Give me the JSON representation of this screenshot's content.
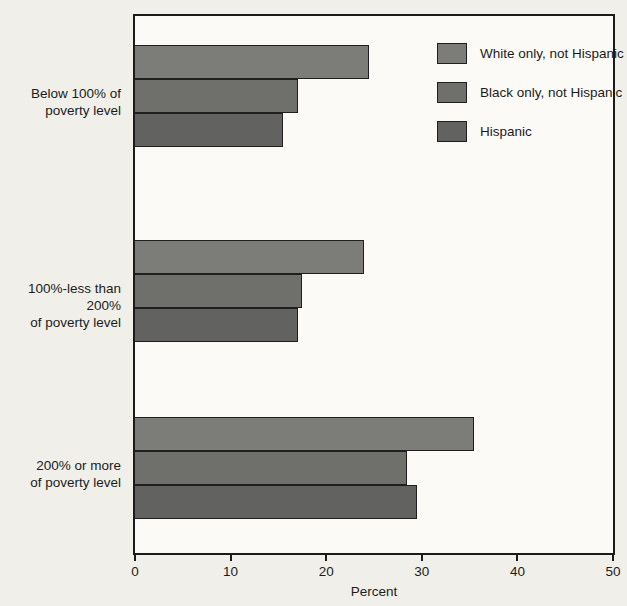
{
  "page": {
    "background_color": "#f0efea",
    "plot_background_color": "#fbfaf7",
    "axis_color": "#1b1b1b",
    "bar_border_color": "#1f1f1f",
    "text_color": "#1c1c1c"
  },
  "chart_data": {
    "type": "bar",
    "orientation": "horizontal",
    "title": "",
    "xlabel": "Percent",
    "ylabel": "",
    "xlim": [
      0,
      50
    ],
    "xticks": [
      "0",
      "10",
      "20",
      "30",
      "40",
      "50"
    ],
    "grid": false,
    "legend_position": "inside-top-right",
    "categories": [
      {
        "id": "below-100-percent-of-poverty-level",
        "lines": [
          "Below 100% of",
          "poverty level"
        ]
      },
      {
        "id": "100-to-less-than-200-percent-of-poverty-level",
        "lines": [
          "100%-less than 200%",
          "of poverty level"
        ]
      },
      {
        "id": "200-percent-or-more-of-poverty-level",
        "lines": [
          "200% or more",
          "of poverty level"
        ]
      }
    ],
    "series": [
      {
        "name": "White only, not Hispanic",
        "color": "#7c7c79",
        "values": [
          24.5,
          24,
          35.5
        ]
      },
      {
        "name": "Black only, not Hispanic",
        "color": "#6f6f6c",
        "values": [
          17,
          17.5,
          28.5
        ]
      },
      {
        "name": "Hispanic",
        "color": "#626260",
        "values": [
          15.5,
          17,
          29.5
        ]
      }
    ]
  }
}
